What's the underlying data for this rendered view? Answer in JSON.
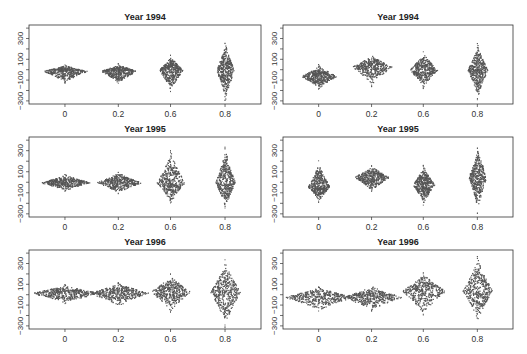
{
  "chart_data": [
    {
      "type": "scatter",
      "subtype": "beeswarm",
      "title": "Year 1994",
      "panel": "top-left",
      "categories": [
        "0",
        "0.2",
        "0.6",
        "0.8"
      ],
      "yticks": [
        -300,
        -100,
        100,
        300
      ],
      "ylim": [
        -330,
        430
      ],
      "groups": [
        {
          "x": "0",
          "center": -10,
          "spread_up": 60,
          "spread_down": 110,
          "width": 44
        },
        {
          "x": "0.2",
          "center": -10,
          "spread_up": 70,
          "spread_down": 120,
          "width": 36
        },
        {
          "x": "0.6",
          "center": 0,
          "spread_up": 140,
          "spread_down": 210,
          "width": 24
        },
        {
          "x": "0.8",
          "center": 0,
          "spread_up": 260,
          "spread_down": 300,
          "width": 18
        }
      ]
    },
    {
      "type": "scatter",
      "subtype": "beeswarm",
      "title": "Year 1994",
      "panel": "top-right",
      "categories": [
        "0",
        "0.2",
        "0.6",
        "0.8"
      ],
      "yticks": [
        -300,
        -100,
        100,
        300
      ],
      "ylim": [
        -330,
        430
      ],
      "groups": [
        {
          "x": "0",
          "center": -60,
          "spread_up": 110,
          "spread_down": 120,
          "width": 36
        },
        {
          "x": "0.2",
          "center": 30,
          "spread_up": 120,
          "spread_down": 180,
          "width": 40
        },
        {
          "x": "0.6",
          "center": 0,
          "spread_up": 180,
          "spread_down": 170,
          "width": 28
        },
        {
          "x": "0.8",
          "center": 0,
          "spread_up": 250,
          "spread_down": 270,
          "width": 20
        }
      ]
    },
    {
      "type": "scatter",
      "subtype": "beeswarm",
      "title": "Year 1995",
      "panel": "middle-left",
      "categories": [
        "0",
        "0.2",
        "0.6",
        "0.8"
      ],
      "yticks": [
        -300,
        -100,
        100,
        300
      ],
      "ylim": [
        -330,
        430
      ],
      "groups": [
        {
          "x": "0",
          "center": 0,
          "spread_up": 80,
          "spread_down": 80,
          "width": 50
        },
        {
          "x": "0.2",
          "center": 0,
          "spread_up": 100,
          "spread_down": 100,
          "width": 46
        },
        {
          "x": "0.6",
          "center": 0,
          "spread_up": 300,
          "spread_down": 200,
          "width": 28
        },
        {
          "x": "0.8",
          "center": 0,
          "spread_up": 330,
          "spread_down": 250,
          "width": 20
        }
      ]
    },
    {
      "type": "scatter",
      "subtype": "beeswarm",
      "title": "Year 1995",
      "panel": "middle-right",
      "categories": [
        "0",
        "0.2",
        "0.6",
        "0.8"
      ],
      "yticks": [
        -300,
        -100,
        100,
        300
      ],
      "ylim": [
        -330,
        430
      ],
      "groups": [
        {
          "x": "0",
          "center": -40,
          "spread_up": 240,
          "spread_down": 140,
          "width": 22
        },
        {
          "x": "0.2",
          "center": 50,
          "spread_up": 110,
          "spread_down": 130,
          "width": 36
        },
        {
          "x": "0.6",
          "center": -20,
          "spread_up": 180,
          "spread_down": 190,
          "width": 22
        },
        {
          "x": "0.8",
          "center": 50,
          "spread_up": 290,
          "spread_down": 330,
          "width": 18
        }
      ]
    },
    {
      "type": "scatter",
      "subtype": "beeswarm",
      "title": "Year 1996",
      "panel": "bottom-left",
      "categories": [
        "0",
        "0.2",
        "0.6",
        "0.8"
      ],
      "yticks": [
        -300,
        -100,
        100,
        300
      ],
      "ylim": [
        -330,
        430
      ],
      "groups": [
        {
          "x": "0",
          "center": 20,
          "spread_up": 80,
          "spread_down": 100,
          "width": 70
        },
        {
          "x": "0.2",
          "center": 20,
          "spread_up": 100,
          "spread_down": 130,
          "width": 60
        },
        {
          "x": "0.6",
          "center": 30,
          "spread_up": 170,
          "spread_down": 190,
          "width": 40
        },
        {
          "x": "0.8",
          "center": 30,
          "spread_up": 300,
          "spread_down": 330,
          "width": 30
        }
      ]
    },
    {
      "type": "scatter",
      "subtype": "beeswarm",
      "title": "Year 1996",
      "panel": "bottom-right",
      "categories": [
        "0",
        "0.2",
        "0.6",
        "0.8"
      ],
      "yticks": [
        -300,
        -100,
        100,
        300
      ],
      "ylim": [
        -330,
        430
      ],
      "groups": [
        {
          "x": "0",
          "center": -20,
          "spread_up": 100,
          "spread_down": 130,
          "width": 70
        },
        {
          "x": "0.2",
          "center": -20,
          "spread_up": 110,
          "spread_down": 130,
          "width": 60
        },
        {
          "x": "0.6",
          "center": 40,
          "spread_up": 170,
          "spread_down": 230,
          "width": 44
        },
        {
          "x": "0.8",
          "center": 40,
          "spread_up": 320,
          "spread_down": 290,
          "width": 30
        }
      ]
    }
  ],
  "panels": [
    {
      "title": "Year 1994",
      "xticks": [
        "0",
        "0.2",
        "0.6",
        "0.8"
      ],
      "yticks": [
        "-300",
        "-100",
        "100",
        "300"
      ]
    },
    {
      "title": "Year 1994",
      "xticks": [
        "0",
        "0.2",
        "0.6",
        "0.8"
      ],
      "yticks": [
        "-300",
        "-100",
        "100",
        "300"
      ]
    },
    {
      "title": "Year 1995",
      "xticks": [
        "0",
        "0.2",
        "0.6",
        "0.8"
      ],
      "yticks": [
        "-300",
        "-100",
        "100",
        "300"
      ]
    },
    {
      "title": "Year 1995",
      "xticks": [
        "0",
        "0.2",
        "0.6",
        "0.8"
      ],
      "yticks": [
        "-300",
        "-100",
        "100",
        "300"
      ]
    },
    {
      "title": "Year 1996",
      "xticks": [
        "0",
        "0.2",
        "0.6",
        "0.8"
      ],
      "yticks": [
        "-300",
        "-100",
        "100",
        "300"
      ]
    },
    {
      "title": "Year 1996",
      "xticks": [
        "0",
        "0.2",
        "0.6",
        "0.8"
      ],
      "yticks": [
        "-300",
        "-100",
        "100",
        "300"
      ]
    }
  ],
  "colors": {
    "points": "#555555",
    "axis": "#333333",
    "background": "#ffffff"
  }
}
